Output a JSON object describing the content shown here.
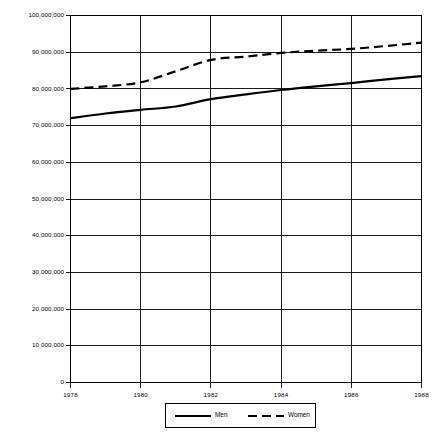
{
  "chart_data": {
    "type": "line",
    "title": "",
    "subtitle": "",
    "xlabel": "",
    "ylabel": "",
    "x": [
      1978,
      1979,
      1980,
      1981,
      1982,
      1983,
      1984,
      1985,
      1986,
      1987,
      1988
    ],
    "xlim": [
      1978,
      1988
    ],
    "ylim": [
      0,
      100000000
    ],
    "grid": true,
    "legend_position": "bottom",
    "xtick_labels": [
      "1978",
      "1980",
      "1982",
      "1984",
      "1986",
      "1988"
    ],
    "xtick_values": [
      1978,
      1980,
      1982,
      1984,
      1986,
      1988
    ],
    "ytick_labels": [
      "0",
      "10,000,000",
      "20,000,000",
      "30,000,000",
      "40,000,000",
      "50,000,000",
      "60,000,000",
      "70,000,000",
      "80,000,000",
      "90,000,000",
      "100,000,000"
    ],
    "ytick_values": [
      0,
      10000000,
      20000000,
      30000000,
      40000000,
      50000000,
      60000000,
      70000000,
      80000000,
      90000000,
      100000000
    ],
    "series": [
      {
        "name": "Men",
        "style": "solid",
        "color": "#000000",
        "values": [
          72000000,
          73300000,
          74300000,
          75200000,
          77200000,
          78500000,
          79700000,
          80700000,
          81600000,
          82600000,
          83500000
        ]
      },
      {
        "name": "Women",
        "style": "dashed",
        "color": "#000000",
        "values": [
          80000000,
          80700000,
          81800000,
          84800000,
          87900000,
          88800000,
          89800000,
          90400000,
          90900000,
          91700000,
          92600000
        ]
      }
    ]
  },
  "legend": {
    "items": [
      {
        "label": "Men",
        "style": "solid"
      },
      {
        "label": "Women",
        "style": "dashed"
      }
    ]
  }
}
